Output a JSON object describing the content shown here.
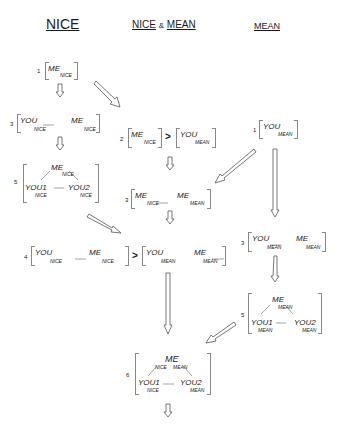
{
  "headers": {
    "nice": "NICE",
    "nice_and_mean": {
      "left": "NICE",
      "amp": "&",
      "right": "MEAN"
    },
    "mean": "MEAN"
  },
  "nodes": {
    "nice_1": {
      "num": "1",
      "me": "ME",
      "me_sub": "NICE"
    },
    "nice_3": {
      "num": "3",
      "you": "YOU",
      "you_sub": "NICE",
      "me": "ME",
      "me_sub": "NICE"
    },
    "nice_5": {
      "num": "5",
      "me": "ME",
      "me_sub": "NICE",
      "you1": "YOU1",
      "you1_sub": "NICE",
      "you2": "YOU2",
      "you2_sub": "NICE"
    },
    "mid_2": {
      "num": "2",
      "me": "ME",
      "me_sub": "NICE",
      "gt": ">",
      "you": "YOU",
      "you_sub": "MEAN"
    },
    "mid_3": {
      "num": "3",
      "me1": "ME",
      "me1_sub": "NICE",
      "me2": "ME",
      "me2_sub": "MEAN"
    },
    "mid_4": {
      "num": "4",
      "you1": "YOU",
      "you1_sub": "NICE",
      "me1": "ME",
      "me1_sub": "NICE",
      "gt": ">",
      "you2": "YOU",
      "you2_sub": "MEAN",
      "me2": "ME",
      "me2_sub": "MEAN"
    },
    "mean_1": {
      "num": "1",
      "you": "YOU",
      "you_sub": "MEAN"
    },
    "mean_3": {
      "num": "3",
      "you": "YOU",
      "you_sub": "MEAN",
      "me": "ME",
      "me_sub": "MEAN"
    },
    "mean_5": {
      "num": "5",
      "me": "ME",
      "me_sub": "MEAN",
      "you1": "YOU1",
      "you1_sub": "MEAN",
      "you2": "YOU2",
      "you2_sub": "MEAN"
    },
    "final_6": {
      "num": "6",
      "me": "ME",
      "me_sub1": "NICE",
      "me_sub2": "MEAN",
      "you1": "YOU1",
      "you1_sub": "NICE",
      "you2": "YOU2",
      "you2_sub": "MEAN"
    }
  },
  "edges": [
    {
      "from": "nice_1",
      "to": "nice_3",
      "style": "hollow-arrow"
    },
    {
      "from": "nice_1",
      "to": "mid_2",
      "style": "hollow-arrow"
    },
    {
      "from": "nice_3",
      "to": "nice_5",
      "style": "hollow-arrow"
    },
    {
      "from": "nice_5",
      "to": "mid_4",
      "style": "hollow-arrow"
    },
    {
      "from": "mid_2",
      "to": "mid_3",
      "style": "hollow-arrow"
    },
    {
      "from": "mean_1",
      "to": "mid_3",
      "style": "hollow-arrow"
    },
    {
      "from": "mean_1",
      "to": "mean_3",
      "style": "hollow-arrow"
    },
    {
      "from": "mid_3",
      "to": "mid_4",
      "style": "hollow-arrow"
    },
    {
      "from": "mean_3",
      "to": "mean_5",
      "style": "hollow-arrow"
    },
    {
      "from": "mid_4",
      "to": "final_6",
      "style": "hollow-arrow"
    },
    {
      "from": "mean_5",
      "to": "final_6",
      "style": "hollow-arrow"
    },
    {
      "from": "final_6",
      "to": "below",
      "style": "hollow-arrow"
    }
  ],
  "colors": {
    "ink": "#1a1a1a",
    "bracket": "#888888",
    "arrow": "#555555"
  }
}
